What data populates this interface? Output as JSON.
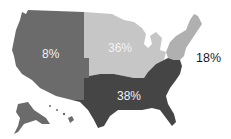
{
  "map": {
    "title": "",
    "regions": [
      {
        "name": "West",
        "value": "8%",
        "color": "#6b6b6b",
        "label_color": "#f2f2f2"
      },
      {
        "name": "Midwest",
        "value": "36%",
        "color": "#c6c6c6",
        "label_color": "#f2f2f2"
      },
      {
        "name": "Northeast",
        "value": "18%",
        "color": "#b0b0b0",
        "label_color": "#1a1a1a"
      },
      {
        "name": "South",
        "value": "38%",
        "color": "#454545",
        "label_color": "#f2f2f2"
      }
    ]
  }
}
